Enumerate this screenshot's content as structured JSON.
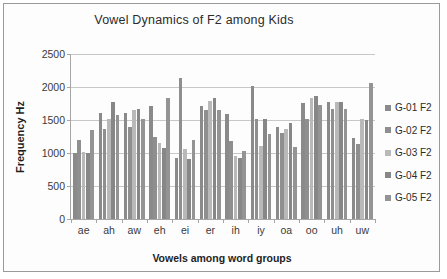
{
  "chart_data": {
    "type": "bar",
    "title": "Vowel Dynamics of F2 among Kids",
    "xlabel": "Vowels among word groups",
    "ylabel": "Frequency Hz",
    "ylim": [
      0,
      2500
    ],
    "yticks": [
      0,
      500,
      1000,
      1500,
      2000,
      2500
    ],
    "grid": true,
    "legend_position": "right",
    "categories": [
      "ae",
      "ah",
      "aw",
      "eh",
      "ei",
      "er",
      "ih",
      "iy",
      "oa",
      "oo",
      "uh",
      "uw"
    ],
    "series": [
      {
        "name": "G-01 F2",
        "color": "#8a8a8a",
        "values": [
          1000,
          1610,
          1610,
          1710,
          930,
          1710,
          1590,
          2010,
          1390,
          1760,
          1780,
          1220
        ]
      },
      {
        "name": "G-02 F2",
        "color": "#8f8f8f",
        "values": [
          1190,
          1370,
          1390,
          1240,
          2130,
          1650,
          1180,
          1520,
          1310,
          1510,
          1670,
          1130
        ]
      },
      {
        "name": "G-03 F2",
        "color": "#b9b9b9",
        "values": [
          1010,
          1510,
          1650,
          1150,
          1060,
          1790,
          960,
          1110,
          1360,
          1840,
          1780,
          1520
        ]
      },
      {
        "name": "G-04 F2",
        "color": "#878787",
        "values": [
          1000,
          1770,
          1670,
          1070,
          910,
          1840,
          930,
          1510,
          1450,
          1860,
          1770,
          1500
        ]
      },
      {
        "name": "G-05 F2",
        "color": "#949494",
        "values": [
          1350,
          1570,
          1520,
          1840,
          1200,
          1650,
          1030,
          1290,
          1090,
          1720,
          1670,
          2060
        ]
      }
    ]
  }
}
